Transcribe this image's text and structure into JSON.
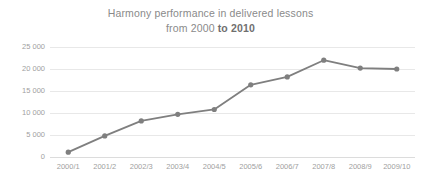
{
  "chart_data": {
    "type": "line",
    "title": "Harmony performance in delivered lessons from 2000 to 2010",
    "title_line1": "Harmony performance in delivered lessons",
    "title_line2_prefix": "from 2000 ",
    "title_line2_bold": "to 2010",
    "xlabel": "",
    "ylabel": "",
    "categories": [
      "2000/1",
      "2001/2",
      "2002/3",
      "2003/4",
      "2004/5",
      "2005/6",
      "2006/7",
      "2007/8",
      "2008/9",
      "2009/10"
    ],
    "values": [
      1100,
      4800,
      8200,
      9700,
      10800,
      16400,
      18200,
      22000,
      20200,
      20000
    ],
    "series": [
      {
        "name": "Delivered lessons",
        "values": [
          1100,
          4800,
          8200,
          9700,
          10800,
          16400,
          18200,
          22000,
          20200,
          20000
        ]
      }
    ],
    "ylim": [
      0,
      25000
    ],
    "ytick_values": [
      0,
      5000,
      10000,
      15000,
      20000,
      25000
    ],
    "ytick_labels": [
      "0",
      "5 000",
      "10 000",
      "15 000",
      "20 000",
      "25 000"
    ],
    "grid": true,
    "legend": false,
    "legend_position": "none",
    "line_color": "#7f7f7f",
    "marker_color": "#7f7f7f",
    "grid_color": "#e8e8e8",
    "text_color": "#8a8a8a",
    "background": "#ffffff"
  }
}
